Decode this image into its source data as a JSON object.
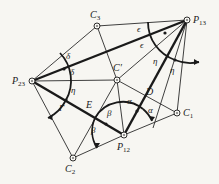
{
  "figure": {
    "points": {
      "C3": {
        "label": "C",
        "sub": "3",
        "x": 97,
        "y": 26
      },
      "P13": {
        "label": "P",
        "sub": "13",
        "x": 187,
        "y": 20
      },
      "P23": {
        "label": "P",
        "sub": "23",
        "x": 32,
        "y": 81
      },
      "Cp": {
        "label": "C′",
        "sub": "",
        "x": 117,
        "y": 80
      },
      "C1": {
        "label": "C",
        "sub": "1",
        "x": 177,
        "y": 113
      },
      "P12": {
        "label": "P",
        "sub": "12",
        "x": 124,
        "y": 135
      },
      "C2": {
        "label": "C",
        "sub": "2",
        "x": 73,
        "y": 158
      }
    },
    "line_labels": {
      "D": "D",
      "E": "E"
    },
    "angles": {
      "alpha": "α",
      "beta": "β",
      "gamma": "Γ",
      "delta": "δ",
      "epsilon": "ϵ",
      "eta": "η"
    }
  }
}
